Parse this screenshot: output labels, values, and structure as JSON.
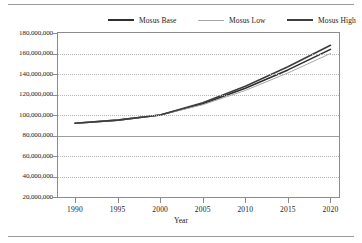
{
  "chart_data": {
    "type": "line",
    "title": "",
    "xlabel": "Year",
    "ylabel": "",
    "grid": true,
    "legend_position": "top",
    "xlim": [
      1988,
      2021
    ],
    "ylim": [
      20000000,
      180000000
    ],
    "x": [
      1990,
      1995,
      2000,
      2005,
      2010,
      2015,
      2020
    ],
    "xticklabels": [
      "1990",
      "1995",
      "2000",
      "2005",
      "2010",
      "2015",
      "2020"
    ],
    "yticklabels": [
      "180,000,000",
      "160,000,000",
      "140,000,000",
      "120,000,000",
      "100,000,000",
      "80,000,000",
      "60,000,000",
      "40,000,000",
      "20,000,000"
    ],
    "yticks": [
      180000000,
      160000000,
      140000000,
      120000000,
      100000000,
      80000000,
      60000000,
      40000000,
      20000000
    ],
    "series": [
      {
        "name": "Mosus Base",
        "color": "#2f2f2f",
        "values": [
          92000000,
          95000000,
          100000000,
          111000000,
          126000000,
          144000000,
          164000000
        ]
      },
      {
        "name": "Mosus Low",
        "color": "#a8a8a8",
        "values": [
          92000000,
          95000000,
          100000000,
          110000000,
          124000000,
          141000000,
          160000000
        ]
      },
      {
        "name": "Mosus High",
        "color": "#3d3d3d",
        "values": [
          92000000,
          95000000,
          100000000,
          112000000,
          128000000,
          147000000,
          168000000
        ]
      }
    ]
  },
  "legend": {
    "entries": [
      {
        "label": "Mosus Base"
      },
      {
        "label": "Mosus Low"
      },
      {
        "label": "Mosus High"
      }
    ]
  },
  "axis": {
    "x_title": "Year"
  }
}
